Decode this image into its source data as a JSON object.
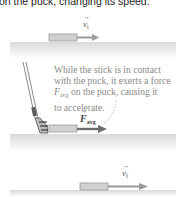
{
  "caption": "on the puck, changing its speed.",
  "labels": {
    "v_initial": "v",
    "v_initial_sub": "i",
    "force": "F",
    "force_sub": "avg",
    "v_final": "v",
    "v_final_sub": "f",
    "vector_arrow": "→"
  },
  "note": {
    "line1": "While the stick is in contact",
    "line2": "with the puck, it exerts a force",
    "force_symbol": "F",
    "force_sub": "avg",
    "line3_rest": " on the puck, causing it",
    "line4": "to accelerate."
  },
  "colors": {
    "ice": "#e2e2e2",
    "puck": "#c8c8c8",
    "arrow": "#8c8c8c",
    "force_arrow": "#6e6e6e",
    "text": "#8a8a8a"
  }
}
